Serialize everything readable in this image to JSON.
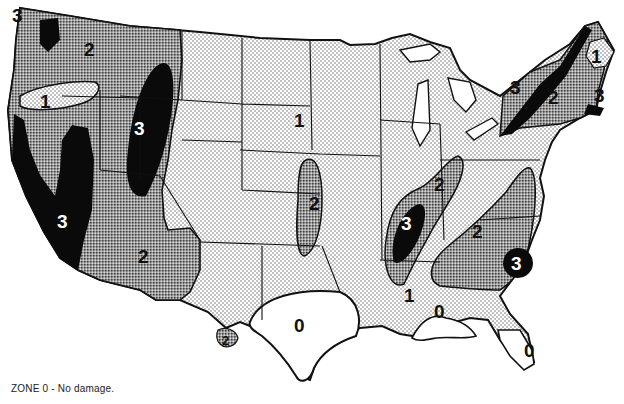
{
  "map": {
    "subject": "Continental United States damage zone map",
    "legend": {
      "text": "ZONE 0 - No damage."
    },
    "zones": [
      {
        "id": "0",
        "fill": "white",
        "description": "No damage"
      },
      {
        "id": "1",
        "fill": "light-stipple"
      },
      {
        "id": "2",
        "fill": "medium-screen"
      },
      {
        "id": "3",
        "fill": "solid-black"
      }
    ],
    "labels": [
      {
        "text": "3",
        "x": 20,
        "y": 20,
        "zone": "3",
        "region": "Puget Sound, WA"
      },
      {
        "text": "2",
        "x": 90,
        "y": 52,
        "zone": "2",
        "region": "Washington"
      },
      {
        "text": "1",
        "x": 45,
        "y": 104,
        "zone": "1",
        "region": "Oregon"
      },
      {
        "text": "3",
        "x": 140,
        "y": 130,
        "zone": "3",
        "region": "Intermountain (UT/ID/MT)"
      },
      {
        "text": "3",
        "x": 62,
        "y": 230,
        "zone": "3",
        "region": "California coast"
      },
      {
        "text": "2",
        "x": 145,
        "y": 258,
        "zone": "2",
        "region": "Arizona"
      },
      {
        "text": "2",
        "x": 229,
        "y": 340,
        "zone": "2",
        "region": "West Texas"
      },
      {
        "text": "1",
        "x": 300,
        "y": 121,
        "zone": "1",
        "region": "Great Plains"
      },
      {
        "text": "2",
        "x": 315,
        "y": 205,
        "zone": "2",
        "region": "Kansas/Nebraska"
      },
      {
        "text": "0",
        "x": 300,
        "y": 327,
        "zone": "0",
        "region": "Texas"
      },
      {
        "text": "3",
        "x": 408,
        "y": 226,
        "zone": "3",
        "region": "New Madrid"
      },
      {
        "text": "2",
        "x": 441,
        "y": 186,
        "zone": "2",
        "region": "Ohio Valley"
      },
      {
        "text": "1",
        "x": 410,
        "y": 297,
        "zone": "1",
        "region": "Mississippi"
      },
      {
        "text": "0",
        "x": 440,
        "y": 313,
        "zone": "0",
        "region": "Gulf coast"
      },
      {
        "text": "2",
        "x": 478,
        "y": 233,
        "zone": "2",
        "region": "Appalachia"
      },
      {
        "text": "3",
        "x": 516,
        "y": 262,
        "zone": "3",
        "region": "Charleston, SC"
      },
      {
        "text": "0",
        "x": 530,
        "y": 352,
        "zone": "0",
        "region": "Florida"
      },
      {
        "text": "3",
        "x": 516,
        "y": 90,
        "zone": "3",
        "region": "St. Lawrence"
      },
      {
        "text": "2",
        "x": 554,
        "y": 100,
        "zone": "2",
        "region": "New England"
      },
      {
        "text": "3",
        "x": 599,
        "y": 97,
        "zone": "3",
        "region": "Boston"
      },
      {
        "text": "1",
        "x": 597,
        "y": 59,
        "zone": "1",
        "region": "Maine"
      }
    ]
  }
}
